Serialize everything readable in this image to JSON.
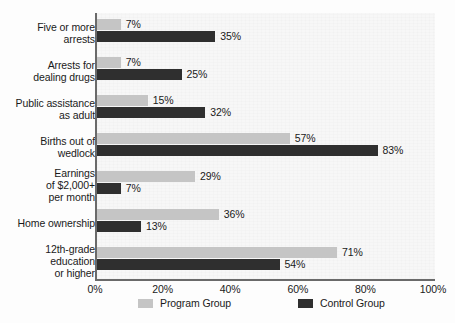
{
  "chart_data": {
    "type": "bar",
    "orientation": "horizontal",
    "title": "",
    "subtitle": "",
    "xlabel": "",
    "ylabel": "",
    "xlim": [
      0,
      100
    ],
    "xticks": [
      "0%",
      "20%",
      "40%",
      "60%",
      "80%",
      "100%"
    ],
    "xtick_values": [
      0,
      20,
      40,
      60,
      80,
      100
    ],
    "grid": false,
    "legend_position": "bottom",
    "categories": [
      "Five or more\narrests",
      "Arrests for\ndealing drugs",
      "Public assistance\nas adult",
      "Births out of\nwedlock",
      "Earnings\nof $2,000+\nper month",
      "Home ownership",
      "12th-grade\neducation\nor higher"
    ],
    "series": [
      {
        "name": "Program Group",
        "color": "#c5c5c5",
        "values": [
          7,
          7,
          15,
          57,
          29,
          36,
          71
        ],
        "labels": [
          "7%",
          "7%",
          "15%",
          "57%",
          "29%",
          "36%",
          "71%"
        ]
      },
      {
        "name": "Control Group",
        "color": "#2f2f2f",
        "values": [
          35,
          25,
          32,
          83,
          7,
          13,
          54
        ],
        "labels": [
          "35%",
          "25%",
          "32%",
          "83%",
          "7%",
          "13%",
          "54%"
        ]
      }
    ]
  },
  "legend": {
    "items": [
      {
        "label": "Program Group",
        "swatch": "program"
      },
      {
        "label": "Control Group",
        "swatch": "control"
      }
    ]
  }
}
